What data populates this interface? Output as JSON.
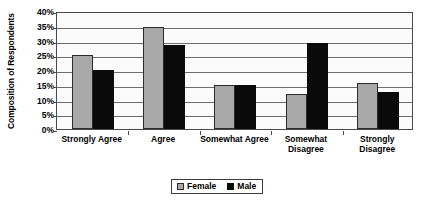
{
  "chart_data": {
    "type": "bar",
    "title": "",
    "xlabel": "",
    "ylabel": "Composition of Respondents",
    "ylim": [
      0,
      40
    ],
    "ytick_labels": [
      "40%",
      "35%",
      "30%",
      "25%",
      "20%",
      "15%",
      "10%",
      "5%",
      "0%"
    ],
    "ytick_values": [
      40,
      35,
      30,
      25,
      20,
      15,
      10,
      5,
      0
    ],
    "grid": true,
    "legend_position": "bottom-center",
    "categories": [
      "Strongly Agree",
      "Agree",
      "Somewhat Agree",
      "Somewhat Disagree",
      "Strongly Disagree"
    ],
    "category_lines": [
      [
        "Strongly Agree"
      ],
      [
        "Agree"
      ],
      [
        "Somewhat Agree"
      ],
      [
        "Somewhat",
        "Disagree"
      ],
      [
        "Strongly Disagree"
      ]
    ],
    "series": [
      {
        "name": "Female",
        "color": "#a8a8a8",
        "values": [
          25,
          34.5,
          15,
          12,
          15.5
        ]
      },
      {
        "name": "Male",
        "color": "#0a0a0a",
        "values": [
          20,
          28.5,
          15,
          29,
          12.5
        ]
      }
    ]
  },
  "legend": {
    "items": [
      {
        "label": "Female",
        "swatch": "female-swatch"
      },
      {
        "label": "Male",
        "swatch": "male-swatch"
      }
    ]
  }
}
